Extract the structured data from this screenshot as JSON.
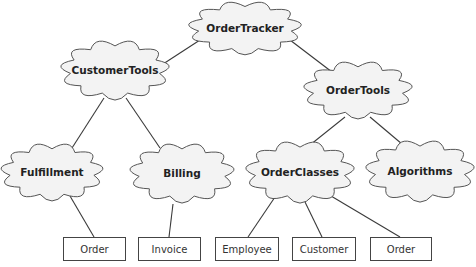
{
  "diagram": {
    "type": "package-hierarchy",
    "clouds": [
      {
        "id": "ordertracker",
        "label": "OrderTracker",
        "cx": 245,
        "cy": 28,
        "rx": 52,
        "ry": 25
      },
      {
        "id": "customertools",
        "label": "CustomerTools",
        "cx": 115,
        "cy": 70,
        "rx": 50,
        "ry": 28
      },
      {
        "id": "ordertools",
        "label": "OrderTools",
        "cx": 358,
        "cy": 90,
        "rx": 50,
        "ry": 27
      },
      {
        "id": "fulfillment",
        "label": "Fulfillment",
        "cx": 52,
        "cy": 172,
        "rx": 47,
        "ry": 27
      },
      {
        "id": "billing",
        "label": "Billing",
        "cx": 182,
        "cy": 173,
        "rx": 48,
        "ry": 28
      },
      {
        "id": "orderclasses",
        "label": "OrderClasses",
        "cx": 300,
        "cy": 172,
        "rx": 50,
        "ry": 29
      },
      {
        "id": "algorithms",
        "label": "Algorithms",
        "cx": 420,
        "cy": 171,
        "rx": 50,
        "ry": 29
      }
    ],
    "boxes": [
      {
        "id": "order-1",
        "label": "Order",
        "x": 63,
        "y": 237,
        "w": 62,
        "h": 23
      },
      {
        "id": "invoice",
        "label": "Invoice",
        "x": 138,
        "y": 237,
        "w": 62,
        "h": 23
      },
      {
        "id": "employee",
        "label": "Employee",
        "x": 215,
        "y": 237,
        "w": 63,
        "h": 23
      },
      {
        "id": "customer",
        "label": "Customer",
        "x": 292,
        "y": 237,
        "w": 63,
        "h": 23
      },
      {
        "id": "order-2",
        "label": "Order",
        "x": 370,
        "y": 237,
        "w": 61,
        "h": 23
      }
    ],
    "edges": [
      {
        "from": "ordertracker",
        "to": "customertools",
        "x1": 200,
        "y1": 40,
        "x2": 160,
        "y2": 66
      },
      {
        "from": "ordertracker",
        "to": "ordertools",
        "x1": 290,
        "y1": 40,
        "x2": 332,
        "y2": 72
      },
      {
        "from": "customertools",
        "to": "fulfillment",
        "x1": 104,
        "y1": 98,
        "x2": 72,
        "y2": 148
      },
      {
        "from": "customertools",
        "to": "billing",
        "x1": 126,
        "y1": 98,
        "x2": 160,
        "y2": 148
      },
      {
        "from": "ordertools",
        "to": "orderclasses",
        "x1": 345,
        "y1": 117,
        "x2": 310,
        "y2": 145
      },
      {
        "from": "ordertools",
        "to": "algorithms",
        "x1": 370,
        "y1": 117,
        "x2": 402,
        "y2": 144
      },
      {
        "from": "fulfillment",
        "to": "order-1",
        "x1": 70,
        "y1": 196,
        "x2": 94,
        "y2": 237
      },
      {
        "from": "billing",
        "to": "invoice",
        "x1": 173,
        "y1": 204,
        "x2": 169,
        "y2": 237
      },
      {
        "from": "orderclasses",
        "to": "employee",
        "x1": 275,
        "y1": 197,
        "x2": 248,
        "y2": 237
      },
      {
        "from": "orderclasses",
        "to": "customer",
        "x1": 305,
        "y1": 202,
        "x2": 322,
        "y2": 237
      },
      {
        "from": "orderclasses",
        "to": "order-2",
        "x1": 331,
        "y1": 196,
        "x2": 400,
        "y2": 237
      }
    ]
  },
  "labels": {
    "ordertracker": "OrderTracker",
    "customertools": "CustomerTools",
    "ordertools": "OrderTools",
    "fulfillment": "Fulfillment",
    "billing": "Billing",
    "orderclasses": "OrderClasses",
    "algorithms": "Algorithms",
    "order_1": "Order",
    "invoice": "Invoice",
    "employee": "Employee",
    "customer": "Customer",
    "order_2": "Order"
  }
}
